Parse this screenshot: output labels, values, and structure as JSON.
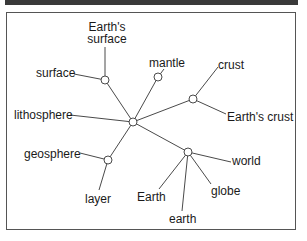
{
  "diagram": {
    "title": "",
    "nodes": [
      {
        "id": "hub",
        "x": 133,
        "y": 122
      },
      {
        "id": "n_surface",
        "x": 105,
        "y": 80
      },
      {
        "id": "n_mantle",
        "x": 158,
        "y": 77
      },
      {
        "id": "n_crust",
        "x": 193,
        "y": 99
      },
      {
        "id": "n_geosphere",
        "x": 108,
        "y": 160
      },
      {
        "id": "n_earth",
        "x": 188,
        "y": 152
      }
    ],
    "labels": {
      "earths_surface_line1": "Earth's",
      "earths_surface_line2": "surface",
      "surface": "surface",
      "mantle": "mantle",
      "crust": "crust",
      "earths_crust": "Earth's crust",
      "lithosphere": "lithosphere",
      "geosphere": "geosphere",
      "layer": "layer",
      "Earth": "Earth",
      "earth": "earth",
      "globe": "globe",
      "world": "world"
    },
    "colors": {
      "line": "#4a4a4a",
      "node_fill": "#ffffff",
      "node_stroke": "#4a4a4a",
      "text": "#1a1a1a",
      "topbar": "#3a3a3a"
    }
  }
}
